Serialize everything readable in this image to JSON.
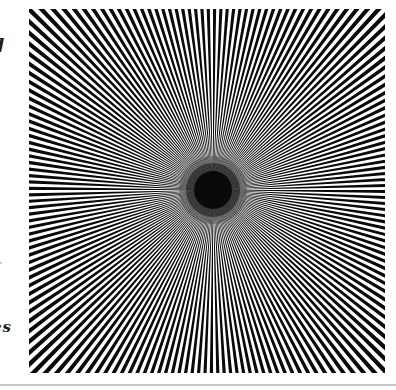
{
  "page": {
    "background_color": "#ffffff",
    "margin_fragments": {
      "top_fragment": "d",
      "middle_fragment": "r",
      "bottom_fragment": "es"
    },
    "bottom_rule_color": "#c8c8c8"
  },
  "figure": {
    "ray_pairs": 180,
    "black_sector_deg": 1,
    "ray_color": "#0a0a0a",
    "background_color": "#ffffff",
    "width": 356,
    "height": 364,
    "center_x": 184,
    "center_y": 181,
    "radius": 262,
    "center_blob": [
      {
        "r": 34,
        "opacity": 0.22
      },
      {
        "r": 27,
        "opacity": 0.5
      },
      {
        "r": 19,
        "opacity": 1
      }
    ]
  }
}
